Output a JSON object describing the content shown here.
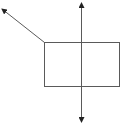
{
  "diagram": {
    "width": 122,
    "height": 124,
    "stroke_color": "#5a5a5a",
    "arrowhead_color": "#222222",
    "rectangle": {
      "x": 44,
      "y": 42,
      "width": 75,
      "height": 44
    },
    "vertical_arrow": {
      "x": 81,
      "y_top": 3,
      "y_bottom": 122,
      "double_headed": true
    },
    "diagonal_arrow": {
      "x1": 44,
      "y1": 42,
      "x2": 2,
      "y2": 9,
      "head_at": "end"
    }
  }
}
